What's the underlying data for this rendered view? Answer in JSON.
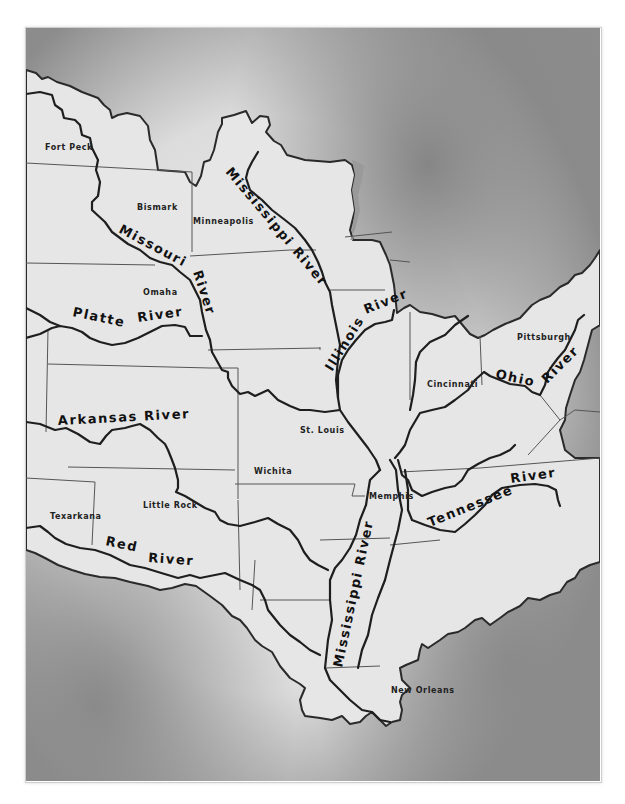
{
  "map": {
    "title": "Mississippi River Basin",
    "colors": {
      "water_dark": "#8a8a8a",
      "water_light": "#e8e8e8",
      "land": "#e6e6e6",
      "outline": "#2a2a2a"
    },
    "cities": [
      {
        "name": "Fort Peck",
        "x": 45,
        "y": 150
      },
      {
        "name": "Bismark",
        "x": 137,
        "y": 210
      },
      {
        "name": "Minneapolis",
        "x": 193,
        "y": 224
      },
      {
        "name": "Omaha",
        "x": 143,
        "y": 295
      },
      {
        "name": "Pittsburgh",
        "x": 517,
        "y": 340
      },
      {
        "name": "Cincinnati",
        "x": 427,
        "y": 387
      },
      {
        "name": "St. Louis",
        "x": 300,
        "y": 433
      },
      {
        "name": "Wichita",
        "x": 254,
        "y": 474
      },
      {
        "name": "Memphis",
        "x": 369,
        "y": 499
      },
      {
        "name": "Little Rock",
        "x": 143,
        "y": 508
      },
      {
        "name": "Texarkana",
        "x": 50,
        "y": 519
      },
      {
        "name": "New Orleans",
        "x": 391,
        "y": 693
      }
    ],
    "rivers": [
      {
        "name": "Missouri River",
        "label_parts": [
          "Missouri",
          "River"
        ]
      },
      {
        "name": "Mississippi River (upper)",
        "label": "Mississippi River"
      },
      {
        "name": "Platte River",
        "label_parts": [
          "Platte",
          "River"
        ]
      },
      {
        "name": "Illinois River",
        "label_parts": [
          "Illinois",
          "River"
        ]
      },
      {
        "name": "Ohio River",
        "label_parts": [
          "Ohio",
          "River"
        ]
      },
      {
        "name": "Arkansas River",
        "label": "Arkansas River"
      },
      {
        "name": "Tennessee River",
        "label_parts": [
          "Tennessee",
          "River"
        ]
      },
      {
        "name": "Red River",
        "label_parts": [
          "Red",
          "River"
        ]
      },
      {
        "name": "Mississippi River (lower)",
        "label": "Mississippi River"
      }
    ]
  }
}
